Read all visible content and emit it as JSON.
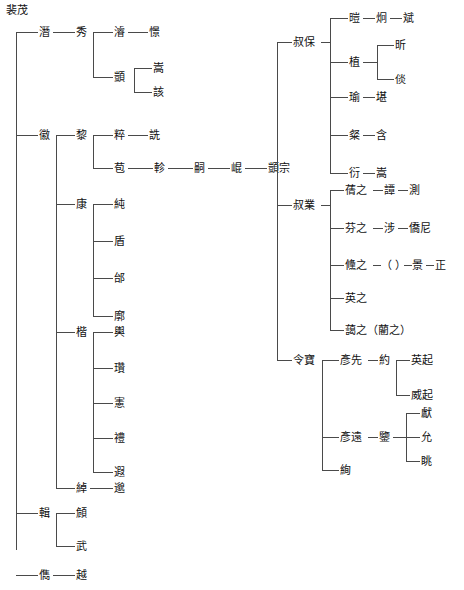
{
  "diagram": {
    "title": "裴茂",
    "type": "genealogy-tree",
    "root_label": "裴茂",
    "line_color": "#4a4a4a",
    "text_color": "#111111"
  },
  "nodes": {
    "root": "裴茂",
    "left_tree": {
      "children": [
        "潛",
        "徽",
        "輯",
        "儁"
      ],
      "qian": {
        "label": "潛",
        "child": "秀",
        "xiu_children": [
          "濬",
          "顗"
        ],
        "jun": {
          "label": "濬",
          "child": "憬"
        },
        "yi": {
          "label": "顗",
          "children": [
            "嵩",
            "該"
          ]
        }
      },
      "hui": {
        "label": "徽",
        "children": [
          "黎",
          "康",
          "楷",
          "綽"
        ],
        "li": {
          "label": "黎",
          "children": [
            "粹",
            "苞"
          ],
          "cui": {
            "label": "粹",
            "child": "詵"
          },
          "bao": {
            "label": "苞",
            "chain": [
              "軫",
              "嗣",
              "崐",
              "顗宗"
            ]
          }
        },
        "kang": {
          "label": "康",
          "children": [
            "純",
            "盾",
            "邰",
            "廓"
          ]
        },
        "kai": {
          "label": "楷",
          "children": [
            "輿",
            "瓚",
            "憲",
            "禮",
            "遐"
          ]
        },
        "chuo": {
          "label": "綽",
          "child": "邈"
        }
      },
      "ji": {
        "label": "輯",
        "children": [
          "頠",
          "武"
        ]
      },
      "jun2": {
        "label": "儁",
        "child": "越"
      }
    },
    "right_tree": {
      "children": [
        "叔保",
        "叔業",
        "令寶"
      ],
      "shubao": {
        "label": "叔保",
        "children": [
          "暟",
          "植",
          "瑜",
          "粲",
          "衍"
        ],
        "kai2": {
          "label": "暟",
          "chain": [
            "炯",
            "斌"
          ]
        },
        "zhi": {
          "label": "植",
          "children": [
            "昕",
            "倓"
          ]
        },
        "yu": {
          "label": "瑜",
          "child": "堪"
        },
        "can": {
          "label": "粲",
          "child": "含"
        },
        "yan": {
          "label": "衍",
          "child": "嵩"
        }
      },
      "shuye": {
        "label": "叔業",
        "children": [
          "蒨之",
          "芬之",
          "儵之",
          "英之",
          "藹之（藺之）"
        ],
        "qianzhi": {
          "label": "蒨之",
          "chain": [
            "譚",
            "測"
          ]
        },
        "fenzhi": {
          "label": "芬之",
          "chain": [
            "涉",
            "僑尼"
          ]
        },
        "shuzhi": {
          "label": "儵之",
          "chain": [
            "（ ）",
            "景",
            "正"
          ]
        },
        "yingzhi": {
          "label": "英之"
        },
        "aizhi": {
          "label": "藹之（藺之）"
        }
      },
      "lingbao": {
        "label": "令寶",
        "children": [
          "彥先",
          "彥遠",
          "絢"
        ],
        "yanxian": {
          "label": "彥先",
          "child": "約",
          "yue_children": [
            "英起",
            "威起"
          ]
        },
        "yanyuan": {
          "label": "彥遠",
          "child": "鑒",
          "jian_children": [
            "獻",
            "允",
            "眺"
          ]
        },
        "xuan": {
          "label": "絢"
        }
      }
    }
  }
}
